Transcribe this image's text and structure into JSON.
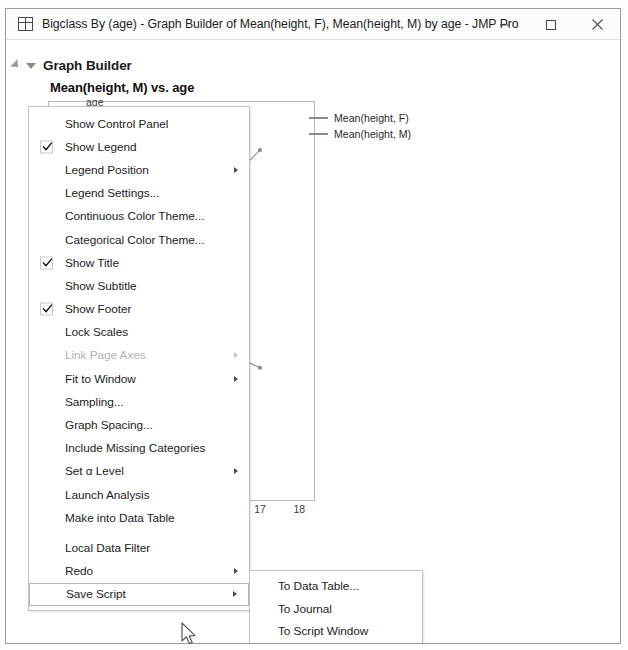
{
  "window": {
    "title": "Bigclass By (age) - Graph Builder of Mean(height, F), Mean(height, M) by age - JMP Pro",
    "icon": "data-table-icon",
    "controls": {
      "minimize": "–",
      "maximize": "□",
      "close": "✕"
    }
  },
  "outline": {
    "title": "Graph Builder"
  },
  "menu": {
    "items": [
      {
        "label": "Show Control Panel",
        "checked": false,
        "submenu": false,
        "disabled": false,
        "separator_after": false
      },
      {
        "label": "Show Legend",
        "checked": true,
        "submenu": false,
        "disabled": false,
        "separator_after": false
      },
      {
        "label": "Legend Position",
        "checked": false,
        "submenu": true,
        "disabled": false,
        "separator_after": false
      },
      {
        "label": "Legend Settings...",
        "checked": false,
        "submenu": false,
        "disabled": false,
        "separator_after": false
      },
      {
        "label": "Continuous Color Theme...",
        "checked": false,
        "submenu": false,
        "disabled": false,
        "separator_after": false
      },
      {
        "label": "Categorical Color Theme...",
        "checked": false,
        "submenu": false,
        "disabled": false,
        "separator_after": false
      },
      {
        "label": "Show Title",
        "checked": true,
        "submenu": false,
        "disabled": false,
        "separator_after": false
      },
      {
        "label": "Show Subtitle",
        "checked": false,
        "submenu": false,
        "disabled": false,
        "separator_after": false
      },
      {
        "label": "Show Footer",
        "checked": true,
        "submenu": false,
        "disabled": false,
        "separator_after": false
      },
      {
        "label": "Lock Scales",
        "checked": false,
        "submenu": false,
        "disabled": false,
        "separator_after": false
      },
      {
        "label": "Link Page Axes",
        "checked": false,
        "submenu": true,
        "disabled": true,
        "separator_after": false
      },
      {
        "label": "Fit to Window",
        "checked": false,
        "submenu": true,
        "disabled": false,
        "separator_after": false
      },
      {
        "label": "Sampling...",
        "checked": false,
        "submenu": false,
        "disabled": false,
        "separator_after": false
      },
      {
        "label": "Graph Spacing...",
        "checked": false,
        "submenu": false,
        "disabled": false,
        "separator_after": false
      },
      {
        "label": "Include Missing Categories",
        "checked": false,
        "submenu": false,
        "disabled": false,
        "separator_after": false
      },
      {
        "label": "Set α Level",
        "checked": false,
        "submenu": true,
        "disabled": false,
        "separator_after": false
      },
      {
        "label": "Launch Analysis",
        "checked": false,
        "submenu": false,
        "disabled": false,
        "separator_after": false
      },
      {
        "label": "Make into Data Table",
        "checked": false,
        "submenu": false,
        "disabled": false,
        "separator_after": true
      },
      {
        "label": "Local Data Filter",
        "checked": false,
        "submenu": false,
        "disabled": false,
        "separator_after": false
      },
      {
        "label": "Redo",
        "checked": false,
        "submenu": true,
        "disabled": false,
        "separator_after": false
      },
      {
        "label": "Save Script",
        "checked": false,
        "submenu": true,
        "disabled": false,
        "separator_after": false,
        "selected": true
      }
    ]
  },
  "submenu": {
    "parent": "Save Script",
    "items": [
      {
        "label": "To Data Table...",
        "hover": false
      },
      {
        "label": "To Journal",
        "hover": false
      },
      {
        "label": "To Script Window",
        "hover": false
      },
      {
        "label": "To Report",
        "hover": false
      },
      {
        "label": "To Clipboard",
        "hover": true
      }
    ]
  },
  "chart_data": {
    "type": "line",
    "title": "Mean(height, M) vs. age",
    "xlabel": "age",
    "ylabel": "",
    "x": [
      12,
      13,
      14,
      15,
      16,
      17
    ],
    "xlim": [
      11.6,
      18.4
    ],
    "xticks": [
      14,
      15,
      16,
      17,
      18
    ],
    "ylim": [
      54,
      72
    ],
    "grid": false,
    "legend_position": "right",
    "series": [
      {
        "name": "Mean(height, F)",
        "color": "#8a8a8a",
        "values": [
          58.4,
          60.3,
          61.0,
          61.6,
          60.8,
          60.0
        ]
      },
      {
        "name": "Mean(height, M)",
        "color": "#8a8a8a",
        "values": [
          59.3,
          63.0,
          63.2,
          63.0,
          68.0,
          69.8
        ]
      }
    ]
  }
}
